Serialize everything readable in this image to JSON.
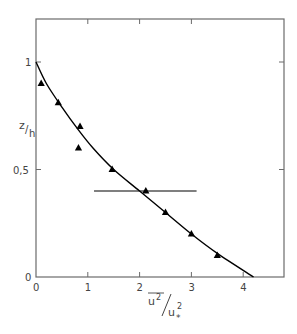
{
  "chart_data": {
    "type": "scatter",
    "title": "",
    "xlabel": "u²/u*²",
    "xlabel_parts": {
      "numerator": "u",
      "numerator_sup": "2",
      "denominator": "u",
      "denominator_sup": "2",
      "denominator_sub": "*"
    },
    "ylabel": "z/h",
    "ylabel_parts": {
      "top": "z",
      "bottom": "h"
    },
    "xlim": [
      0,
      4.75
    ],
    "ylim": [
      0,
      1.07
    ],
    "x_ticks": [
      0,
      1,
      2,
      3,
      4
    ],
    "x_tick_labels": [
      "0",
      "1",
      "2",
      "3",
      "4"
    ],
    "y_ticks": [
      0,
      0.5,
      1
    ],
    "y_tick_labels": [
      "0",
      "0,5",
      "1"
    ],
    "grid": false,
    "legend": null,
    "series": [
      {
        "name": "measurements",
        "marker": "triangle",
        "points": [
          {
            "x": 0.1,
            "y": 0.9
          },
          {
            "x": 0.43,
            "y": 0.81
          },
          {
            "x": 0.85,
            "y": 0.7
          },
          {
            "x": 0.82,
            "y": 0.6
          },
          {
            "x": 1.47,
            "y": 0.5
          },
          {
            "x": 2.12,
            "y": 0.4
          },
          {
            "x": 2.5,
            "y": 0.3
          },
          {
            "x": 3.0,
            "y": 0.2
          },
          {
            "x": 3.5,
            "y": 0.1
          }
        ]
      },
      {
        "name": "fitted-curve",
        "type": "line",
        "points": [
          {
            "x": 0.0,
            "y": 1.0
          },
          {
            "x": 0.2,
            "y": 0.9
          },
          {
            "x": 0.5,
            "y": 0.79
          },
          {
            "x": 0.8,
            "y": 0.69
          },
          {
            "x": 1.1,
            "y": 0.6
          },
          {
            "x": 1.5,
            "y": 0.5
          },
          {
            "x": 2.0,
            "y": 0.4
          },
          {
            "x": 2.5,
            "y": 0.3
          },
          {
            "x": 3.0,
            "y": 0.2
          },
          {
            "x": 3.5,
            "y": 0.11
          },
          {
            "x": 4.2,
            "y": 0.0
          }
        ]
      },
      {
        "name": "horizontal-bar",
        "type": "line",
        "points": [
          {
            "x": 1.12,
            "y": 0.4
          },
          {
            "x": 3.1,
            "y": 0.4
          }
        ]
      }
    ]
  },
  "colors": {
    "axis": "#6b6b6b",
    "data": "#000000",
    "text": "#444444"
  }
}
